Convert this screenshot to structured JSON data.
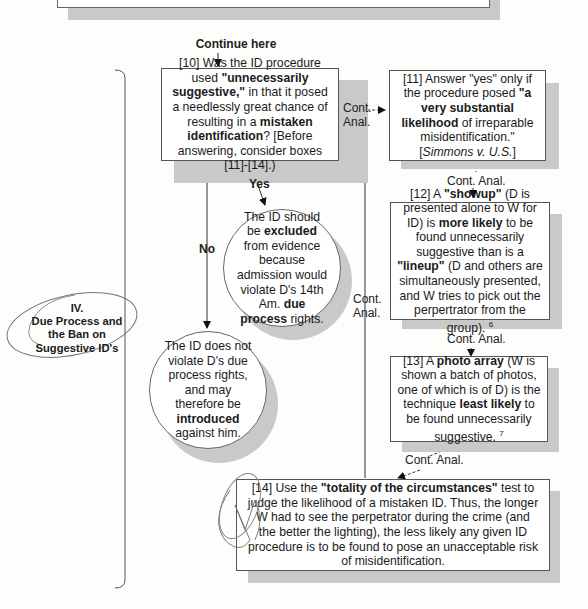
{
  "top_box_fragment": {
    "visible": true
  },
  "continue_label": "Continue here",
  "section": {
    "numeral": "IV.",
    "title_line1": "Due Process and",
    "title_line2": "the Ban on",
    "title_line3": "Suggestive ID's"
  },
  "boxes": {
    "b10": {
      "num": "[10]",
      "t1": " Was the ID procedure used ",
      "b1": "\"unnecessarily suggestive,\"",
      "t2": " in that it posed a needlessly great chance of resulting in a ",
      "b2": "mistaken identification",
      "t3": "? [Before answering, consider boxes [11]-[14].)"
    },
    "b11": {
      "t1": "[11] Answer \"yes\" only if the procedure posed ",
      "b1": "\"a very substantial likelihood",
      "t2": " of irreparable misidentification.\" [",
      "i1": "Simmons v. U.S.",
      "t3": "]"
    },
    "b12": {
      "t1": "[12] A ",
      "b1": "\"showup\"",
      "t2": " (D is presented alone to W for ID) is ",
      "b2": "more likely",
      "t3": " to be found unnecessarily suggestive than is a ",
      "b3": "\"lineup\"",
      "t4": " (D and others are simultaneously presented, and W tries to pick out the perpertrator from the group). ",
      "fn": "6"
    },
    "b13": {
      "t1": "[13] A ",
      "b1": "photo array",
      "t2": " (W is shown a batch of photos, one of which is of D) is the technique ",
      "b2": "least likely",
      "t3": " to be found unnecessarily suggestive. ",
      "fn": "7"
    },
    "b14": {
      "t1": "[14] Use the ",
      "b1": "\"totality of the circumstances\"",
      "t2": " test to judge the likelihood of a mistaken ID. Thus, the longer W had to see the perpetrator during the crime (and the better the lighting), the less likely any given ID procedure is to be found to pose an unacceptable risk of misidentification."
    }
  },
  "circles": {
    "yes_outcome": {
      "t1": "The ID should be ",
      "b1": "excluded",
      "t2": " from evidence because admission would violate D's 14th Am. ",
      "b2": "due process",
      "t3": " rights."
    },
    "no_outcome": {
      "t1": "The ID does not violate D's due process rights, and may therefore be ",
      "b1": "introduced",
      "t2": " against him."
    }
  },
  "edges": {
    "yes": "Yes",
    "no": "No",
    "cont_anal_1a": "Cont.",
    "cont_anal_1b": "Anal.",
    "cont_anal_2": "Cont. Anal.",
    "cont_anal_3": "Cont. Anal.",
    "cont_anal_4": "Cont. Anal.",
    "cont_anal_back_a": "Cont.",
    "cont_anal_back_b": "Anal."
  }
}
